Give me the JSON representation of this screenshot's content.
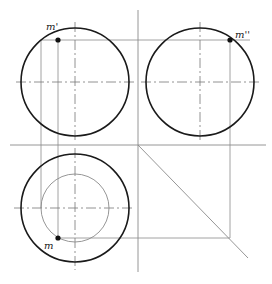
{
  "diagram": {
    "type": "orthographic-projection",
    "colors": {
      "outline": "#1a1a1a",
      "construction": "#8a8a8a",
      "point": "#111111"
    },
    "views": {
      "front": {
        "label": "m'",
        "circle": {
          "cx": 75,
          "cy": 82,
          "r": 54
        },
        "point": {
          "x": 58,
          "y": 40
        }
      },
      "side": {
        "label": "m''",
        "circle": {
          "cx": 200,
          "cy": 82,
          "r": 54
        },
        "point": {
          "x": 230,
          "y": 40
        }
      },
      "top": {
        "label": "m",
        "circle": {
          "cx": 75,
          "cy": 208,
          "r": 54
        },
        "inner_circle": {
          "cx": 75,
          "cy": 208,
          "r": 34
        },
        "point": {
          "x": 58,
          "y": 238
        }
      }
    },
    "labels": {
      "front_point": "m'",
      "side_point": "m''",
      "top_point": "m"
    }
  }
}
